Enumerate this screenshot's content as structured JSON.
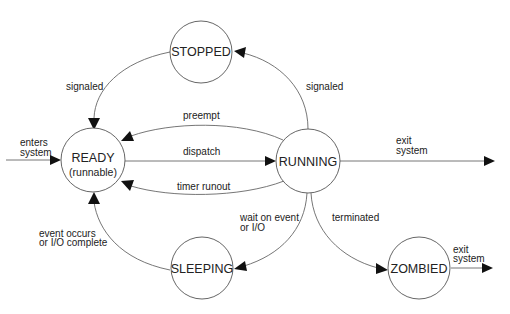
{
  "diagram": {
    "type": "state-transition",
    "states": [
      {
        "id": "stopped",
        "label": "STOPPED"
      },
      {
        "id": "ready",
        "label": "READY",
        "sublabel": "(runnable)"
      },
      {
        "id": "running",
        "label": "RUNNING"
      },
      {
        "id": "sleeping",
        "label": "SLEEPING"
      },
      {
        "id": "zombied",
        "label": "ZOMBIED"
      }
    ],
    "transitions": [
      {
        "from": "external",
        "to": "ready",
        "label_lines": [
          "enters",
          "system"
        ]
      },
      {
        "from": "stopped",
        "to": "ready",
        "label_lines": [
          "signaled"
        ]
      },
      {
        "from": "running",
        "to": "stopped",
        "label_lines": [
          "signaled"
        ]
      },
      {
        "from": "running",
        "to": "ready",
        "label_lines": [
          "preempt"
        ]
      },
      {
        "from": "ready",
        "to": "running",
        "label_lines": [
          "dispatch"
        ]
      },
      {
        "from": "running",
        "to": "ready",
        "label_lines": [
          "timer runout"
        ]
      },
      {
        "from": "running",
        "to": "external",
        "label_lines": [
          "exit",
          "system"
        ]
      },
      {
        "from": "running",
        "to": "sleeping",
        "label_lines": [
          "wait on event",
          "or I/O"
        ]
      },
      {
        "from": "sleeping",
        "to": "ready",
        "label_lines": [
          "event occurs",
          "or I/O complete"
        ]
      },
      {
        "from": "running",
        "to": "zombied",
        "label_lines": [
          "terminated"
        ]
      },
      {
        "from": "zombied",
        "to": "external",
        "label_lines": [
          "exit",
          "system"
        ]
      }
    ]
  }
}
